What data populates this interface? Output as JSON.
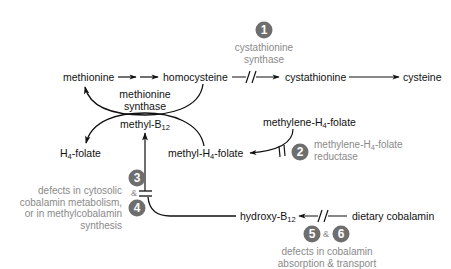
{
  "diagram": {
    "nodes": {
      "methionine": "methionine",
      "homocysteine": "homocysteine",
      "cystathionine": "cystathionine",
      "cysteine": "cysteine",
      "methyl_b12_prefix": "methyl-B",
      "methyl_b12_sub": "12",
      "h4_folate_prefix": "H",
      "h4_folate_sub": "4",
      "h4_folate_suffix": "-folate",
      "methyl_h4_folate_prefix": "methyl-H",
      "methyl_h4_folate_sub": "4",
      "methyl_h4_folate_suffix": "-folate",
      "methylene_h4_folate_prefix": "methylene-H",
      "methylene_h4_folate_sub": "4",
      "methylene_h4_folate_suffix": "-folate",
      "hydroxy_b12_prefix": "hydroxy-B",
      "hydroxy_b12_sub": "12",
      "dietary_cobalamin": "dietary cobalamin"
    },
    "enzymes": {
      "methionine_synthase_line1": "methionine",
      "methionine_synthase_line2": "synthase"
    },
    "defects": [
      {
        "number": "1",
        "lines": [
          "cystathionine",
          "synthase"
        ]
      },
      {
        "number": "2",
        "line1_prefix": "methylene-H",
        "line1_sub": "4",
        "line1_suffix": "-folate",
        "line2": "reductase"
      },
      {
        "number": "3"
      },
      {
        "number": "4"
      },
      {
        "number": "5"
      },
      {
        "number": "6"
      }
    ],
    "defect_3_4_text": [
      "defects in cytosolic",
      "cobalamin metabolism,",
      "or in methylcobalamin",
      "synthesis"
    ],
    "defect_5_6_text": [
      "defects in cobalamin",
      "absorption & transport"
    ],
    "ampersand": "&",
    "colors": {
      "badge": "#6e6e6e",
      "grey_text": "#8a8a8a",
      "line": "#111111"
    }
  }
}
